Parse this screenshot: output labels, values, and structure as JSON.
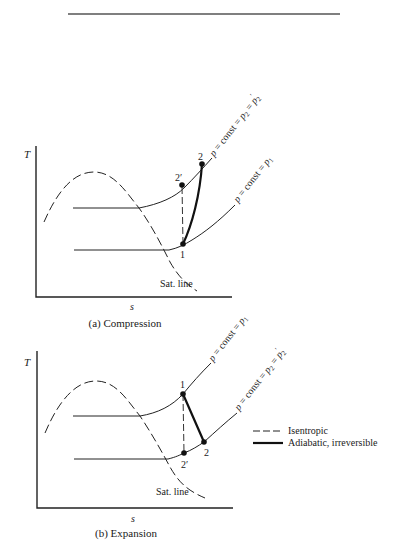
{
  "figure": {
    "top_rule": true,
    "panels": [
      {
        "id": "compression",
        "caption": "(a) Compression",
        "y_axis_label": "T",
        "x_axis_label": "s",
        "sat_line_label": "Sat. line",
        "isobars": [
          {
            "label_p": "p",
            "label_rest": " = const = ",
            "label_sub1": "p",
            "sub1": "2",
            "label_mid": " = ",
            "label_sub2": "p",
            "sub2": "2",
            "prime": "′"
          },
          {
            "label_p": "p",
            "label_rest": " = const = ",
            "label_sub1": "p",
            "sub1": "1"
          }
        ],
        "points": [
          {
            "name": "1",
            "label": "1"
          },
          {
            "name": "2",
            "label": "2"
          },
          {
            "name": "2prime",
            "label": "2′"
          }
        ]
      },
      {
        "id": "expansion",
        "caption": "(b) Expansion",
        "y_axis_label": "T",
        "x_axis_label": "s",
        "sat_line_label": "Sat. line",
        "isobars": [
          {
            "label_p": "p",
            "label_rest": " = const = ",
            "label_sub1": "p",
            "sub1": "1"
          },
          {
            "label_p": "p",
            "label_rest": " = const = ",
            "label_sub1": "p",
            "sub1": "2",
            "label_mid": " = ",
            "label_sub2": "p",
            "sub2": "2",
            "prime": "′"
          }
        ],
        "points": [
          {
            "name": "1",
            "label": "1"
          },
          {
            "name": "2",
            "label": "2"
          },
          {
            "name": "2prime",
            "label": "2′"
          }
        ]
      }
    ],
    "legend": [
      {
        "style": "dashed",
        "label": "Isentropic"
      },
      {
        "style": "solid-bold",
        "label": "Adiabatic, irreversible"
      }
    ]
  }
}
